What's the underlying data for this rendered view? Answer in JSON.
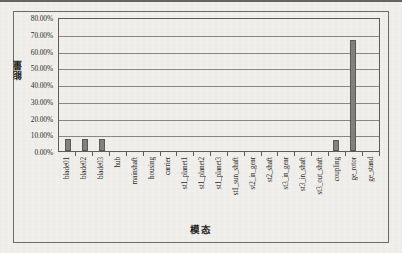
{
  "figure": {
    "frame_border_color": "#6d6b68",
    "background_color": "#f2f0ec"
  },
  "chart_data": {
    "type": "bar",
    "title": "",
    "xlabel": "模态",
    "ylabel": "能量",
    "ylim": [
      0,
      0.8
    ],
    "grid": true,
    "legend": "none",
    "bar_color": "#848280",
    "y_tick_labels": [
      "80.00%",
      "70.00%",
      "60.00%",
      "50.00%",
      "40.00%",
      "30.00%",
      "20.00%",
      "10.00%",
      "0.00%"
    ],
    "y_tick_values": [
      0.8,
      0.7,
      0.6,
      0.5,
      0.4,
      0.3,
      0.2,
      0.1,
      0.0
    ],
    "categories": [
      "blade01",
      "blade02",
      "blade03",
      "hub",
      "mainshaft",
      "housing",
      "carrier",
      "st1_planet1",
      "st1_planet2",
      "st1_planet3",
      "st1_sun_shaft",
      "st2_in_gear",
      "st2_shaft",
      "st3_in_gear",
      "st3_in_shaft",
      "st3_out_shaft",
      "coupling",
      "ge_rotor",
      "ge_stand"
    ],
    "values": [
      0.07,
      0.071,
      0.07,
      0.0,
      0.0,
      0.0,
      0.0,
      0.0,
      0.0,
      0.0,
      0.0,
      0.0,
      0.0,
      0.0,
      0.0,
      0.0,
      0.065,
      0.665,
      0.0
    ]
  }
}
